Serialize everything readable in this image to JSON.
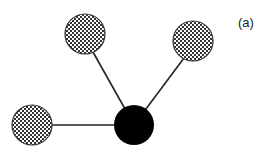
{
  "diagram": {
    "label": "(a)",
    "type": "star graph",
    "center_node": {
      "id": "center",
      "fill": "solid",
      "color": "#000000"
    },
    "leaf_nodes": [
      {
        "id": "leaf-top-left",
        "fill": "checkered"
      },
      {
        "id": "leaf-top-right",
        "fill": "checkered"
      },
      {
        "id": "leaf-left",
        "fill": "checkered"
      }
    ],
    "edges": [
      {
        "from": "center",
        "to": "leaf-top-left"
      },
      {
        "from": "center",
        "to": "leaf-top-right"
      },
      {
        "from": "center",
        "to": "leaf-left"
      }
    ],
    "colors": {
      "edge": "#222222",
      "checker_dark": "#333333",
      "checker_light": "#ffffff"
    }
  }
}
